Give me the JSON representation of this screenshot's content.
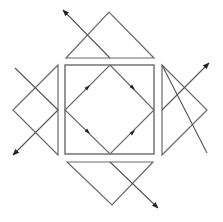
{
  "diagram": {
    "colors": {
      "background": "#ffffff",
      "line": "#6a6a6a",
      "arrow": "#222222"
    },
    "square": {
      "x": 65,
      "y": 65,
      "w": 89,
      "h": 89
    },
    "diamond": [
      [
        110,
        65
      ],
      [
        154,
        110
      ],
      [
        110,
        154
      ],
      [
        65,
        110
      ]
    ],
    "prisms": [
      {
        "name": "top",
        "points": [
          [
            66,
            58
          ],
          [
            109,
            12
          ],
          [
            154,
            58
          ]
        ]
      },
      {
        "name": "right",
        "points": [
          [
            162,
            65
          ],
          [
            207,
            110
          ],
          [
            162,
            155
          ]
        ]
      },
      {
        "name": "bottom",
        "points": [
          [
            67,
            162
          ],
          [
            112,
            205
          ],
          [
            153,
            162
          ]
        ]
      },
      {
        "name": "left",
        "points": [
          [
            58,
            65
          ],
          [
            13,
            110
          ],
          [
            58,
            155
          ]
        ]
      }
    ],
    "rays": [
      {
        "name": "top-ray",
        "from": [
          110,
          58
        ],
        "to": [
          63,
          10
        ],
        "arrow": true
      },
      {
        "name": "right-ray",
        "from": [
          162,
          110
        ],
        "to": [
          209,
          63
        ],
        "arrow": true
      },
      {
        "name": "right-cross",
        "from": [
          162,
          65
        ],
        "to": [
          207,
          153
        ],
        "arrow": false
      },
      {
        "name": "bottom-ray",
        "from": [
          110,
          162
        ],
        "to": [
          158,
          208
        ],
        "arrow": true
      },
      {
        "name": "left-ray",
        "from": [
          58,
          110
        ],
        "to": [
          13,
          155
        ],
        "arrow": true
      },
      {
        "name": "left-cross",
        "from": [
          15,
          68
        ],
        "to": [
          58,
          110
        ],
        "arrow": false
      }
    ],
    "inner_arrows": [
      {
        "at": [
          88,
          87
        ],
        "angle": -45
      },
      {
        "at": [
          133,
          88
        ],
        "angle": 45
      },
      {
        "at": [
          133,
          132
        ],
        "angle": -45
      },
      {
        "at": [
          88,
          132
        ],
        "angle": 45
      }
    ]
  }
}
